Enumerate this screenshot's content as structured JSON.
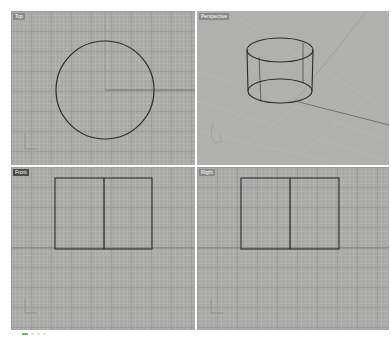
{
  "viewports": [
    {
      "name": "top",
      "label": "Top",
      "active": false
    },
    {
      "name": "perspective",
      "label": "Perspective",
      "active": false
    },
    {
      "name": "front",
      "label": "Front",
      "active": true
    },
    {
      "name": "right",
      "label": "Right",
      "active": false
    }
  ],
  "colors": {
    "viewport_bg": "#a9aaa8",
    "grid_major": "#9d9e9c",
    "geometry": "#2a2a2a",
    "x_axis": "#8b6a6a",
    "y_axis": "#7f8f6e",
    "status_accent": "#6cbf5a"
  },
  "icons": {
    "axis_widget": "world-axes-icon",
    "status": "osnap-status-icon"
  }
}
